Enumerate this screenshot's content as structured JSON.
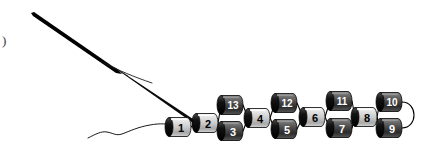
{
  "figure": {
    "caption_label": ")",
    "width": 425,
    "height": 151,
    "background_color": "#ffffff"
  },
  "palette": {
    "dark_body": "#3a3a3a",
    "dark_body_text": "#ffffff",
    "light_body": "#d9d9d9",
    "light_body_text": "#000000",
    "cap_dark": "#000000",
    "cap_light": "#bfbfbf",
    "edge_color": "#000000",
    "outline": "#000000"
  },
  "nodes": [
    {
      "id": "n1",
      "label": "1",
      "cx": 180,
      "cy": 127,
      "style": "light",
      "cap": "dark"
    },
    {
      "id": "n2",
      "label": "2",
      "cx": 207,
      "cy": 123,
      "style": "light",
      "cap": "dark"
    },
    {
      "id": "n13",
      "label": "13",
      "cx": 232,
      "cy": 105,
      "style": "dark",
      "cap": "dark"
    },
    {
      "id": "n3",
      "label": "3",
      "cx": 232,
      "cy": 131,
      "style": "dark",
      "cap": "dark"
    },
    {
      "id": "n4",
      "label": "4",
      "cx": 259,
      "cy": 118,
      "style": "light",
      "cap": "dark"
    },
    {
      "id": "n12",
      "label": "12",
      "cx": 286,
      "cy": 103,
      "style": "dark",
      "cap": "dark"
    },
    {
      "id": "n5",
      "label": "5",
      "cx": 286,
      "cy": 129,
      "style": "dark",
      "cap": "dark"
    },
    {
      "id": "n6",
      "label": "6",
      "cx": 314,
      "cy": 117,
      "style": "light",
      "cap": "dark"
    },
    {
      "id": "n11",
      "label": "11",
      "cx": 341,
      "cy": 101,
      "style": "dark",
      "cap": "dark"
    },
    {
      "id": "n7",
      "label": "7",
      "cx": 341,
      "cy": 128,
      "style": "dark",
      "cap": "dark"
    },
    {
      "id": "n8",
      "label": "8",
      "cx": 366,
      "cy": 117,
      "style": "light",
      "cap": "dark"
    },
    {
      "id": "n10",
      "label": "10",
      "cx": 391,
      "cy": 102,
      "style": "dark",
      "cap": "dark"
    },
    {
      "id": "n9",
      "label": "9",
      "cx": 391,
      "cy": 128,
      "style": "dark",
      "cap": "dark"
    }
  ],
  "edges": [
    {
      "from": "n1",
      "to": "n2"
    },
    {
      "from": "n2",
      "to": "n13"
    },
    {
      "from": "n2",
      "to": "n3"
    },
    {
      "from": "n13",
      "to": "n4"
    },
    {
      "from": "n3",
      "to": "n4"
    },
    {
      "from": "n4",
      "to": "n12"
    },
    {
      "from": "n4",
      "to": "n5"
    },
    {
      "from": "n12",
      "to": "n6"
    },
    {
      "from": "n5",
      "to": "n6"
    },
    {
      "from": "n6",
      "to": "n11"
    },
    {
      "from": "n6",
      "to": "n7"
    },
    {
      "from": "n11",
      "to": "n8"
    },
    {
      "from": "n7",
      "to": "n8"
    },
    {
      "from": "n8",
      "to": "n10"
    },
    {
      "from": "n8",
      "to": "n9"
    }
  ],
  "loop_edge": {
    "name": "terminal-loop-10-9",
    "from": "n10",
    "to": "n9"
  },
  "tails": [
    {
      "name": "thick-tail-upper",
      "description": "thick tapered diagonal stroke from upper-left toward node 2"
    },
    {
      "name": "thin-tail-branch",
      "description": "thin branch splitting off the thick stroke"
    },
    {
      "name": "wavy-tail-lower",
      "description": "thin wavy curve from lower-left into node 1"
    }
  ]
}
